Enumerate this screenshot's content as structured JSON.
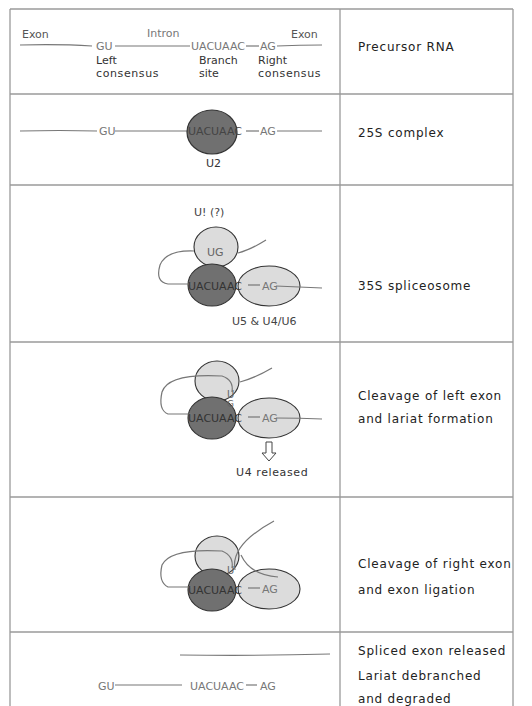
{
  "rows": [
    {
      "stage": "Precursor RNA",
      "labels": {
        "exon_left": "Exon",
        "intron": "Intron",
        "exon_right": "Exon",
        "gu": "GU",
        "branch_seq": "UACUAAC",
        "ag": "AG",
        "left_consensus_1": "Left",
        "left_consensus_2": "consensus",
        "branch_site_1": "Branch",
        "branch_site_2": "site",
        "right_consensus_1": "Right",
        "right_consensus_2": "consensus"
      }
    },
    {
      "stage": "25S complex",
      "labels": {
        "gu": "GU",
        "branch_seq": "UACUAAC",
        "ag": "AG",
        "snrnp": "U2"
      }
    },
    {
      "stage": "35S spliceosome",
      "labels": {
        "u1": "U! (?)",
        "ug": "UG",
        "branch_seq": "UACUAAC",
        "ag": "AG",
        "snrnps": "U5 & U4/U6"
      }
    },
    {
      "stage_line1": "Cleavage of left exon",
      "stage_line2": "and lariat formation",
      "labels": {
        "u": "U",
        "g": "G",
        "branch_seq": "UACUAAC",
        "ag": "AG",
        "released": "U4 released"
      }
    },
    {
      "stage_line1": "Cleavage of right exon",
      "stage_line2": "and exon ligation",
      "labels": {
        "u": "U",
        "branch_seq": "UACUAAC",
        "ag": "AG"
      }
    },
    {
      "stage_line1": "Spliced exon released",
      "stage_line2": "Lariat debranched",
      "stage_line3": "and degraded",
      "labels": {
        "gu": "GU",
        "branch_seq": "UACUAAC",
        "ag": "AG"
      }
    }
  ],
  "colors": {
    "grid": "#9a9a9a",
    "u2_fill": "#707070",
    "light_fill": "#dcdcdc",
    "rna_line": "#777777",
    "text": "#333333"
  }
}
